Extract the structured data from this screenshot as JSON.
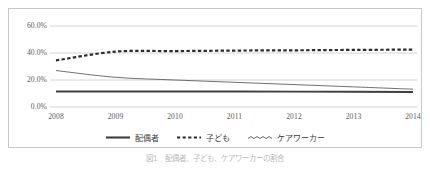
{
  "figure": {
    "caption": "図1　配偶者、子ども、ケアワーカーの割合"
  },
  "legend": {
    "position": "bottom-center",
    "items": [
      {
        "label": "配偶者",
        "marker": "solid-line-marker",
        "color": "#3f3f3f"
      },
      {
        "label": "子ども",
        "marker": "dashed-line-marker",
        "color": "#2b2b2b"
      },
      {
        "label": "ケアワーカー",
        "marker": "thin-line-marker",
        "color": "#555555"
      }
    ]
  },
  "axes": {
    "y_ticks": [
      "0.0%",
      "20.0%",
      "40.0%",
      "60.0%"
    ],
    "x_ticks": [
      "2008",
      "2009",
      "2010",
      "2011",
      "2012",
      "2013",
      "2014"
    ]
  },
  "chart_data": {
    "type": "line",
    "title": "",
    "xlabel": "",
    "ylabel": "",
    "x": [
      2008,
      2009,
      2010,
      2011,
      2012,
      2013,
      2014
    ],
    "categories": [
      "2008",
      "2009",
      "2010",
      "2011",
      "2012",
      "2013",
      "2014"
    ],
    "ylim": [
      0,
      60
    ],
    "ytick_values": [
      0,
      20,
      40,
      60
    ],
    "ytick_labels": [
      "0.0%",
      "20.0%",
      "40.0%",
      "60.0%"
    ],
    "grid": "horizontal",
    "legend_position": "bottom-center",
    "units": "percent",
    "series": [
      {
        "name": "配偶者",
        "style": "solid",
        "color": "#3f3f3f",
        "values": [
          11.5,
          11.5,
          11.5,
          11.5,
          11.4,
          11.3,
          11.1
        ]
      },
      {
        "name": "子ども",
        "style": "dashed",
        "color": "#2b2b2b",
        "values": [
          34.5,
          41.0,
          41.4,
          41.8,
          42.0,
          42.3,
          42.5
        ]
      },
      {
        "name": "ケアワーカー",
        "style": "thin",
        "color": "#555555",
        "values": [
          27.0,
          22.0,
          20.0,
          18.3,
          16.6,
          14.9,
          13.2
        ]
      }
    ]
  }
}
